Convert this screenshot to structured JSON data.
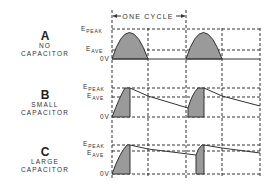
{
  "diagram": {
    "cycle_label": "ONE CYCLE",
    "axis_labels": {
      "peak_main": "E",
      "peak_sub": "PEAK",
      "ave_main": "E",
      "ave_sub": "AVE",
      "zero": "0V"
    },
    "panels": [
      {
        "letter": "A",
        "line1": "NO",
        "line2": "CAPACITOR"
      },
      {
        "letter": "B",
        "line1": "SMALL",
        "line2": "CAPACITOR"
      },
      {
        "letter": "C",
        "line1": "LARGE",
        "line2": "CAPACITOR"
      }
    ],
    "colors": {
      "line": "#333333",
      "shade": "#9a9a9a",
      "dash": "#333333"
    }
  }
}
